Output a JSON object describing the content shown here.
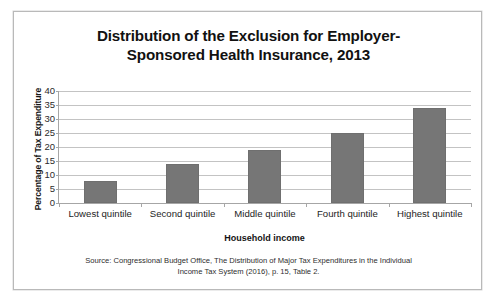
{
  "figure": {
    "title_line1": "Distribution of the Exclusion for Employer-",
    "title_line2": "Sponsored Health Insurance, 2013",
    "source_line1": "Source:  Congressional Budget Office, The Distribution of Major Tax Expenditures in the Individual",
    "source_line2": "Income Tax System (2016), p. 15, Table 2.",
    "bar_color": "#767676",
    "gridline_color": "#c3c3c3",
    "axis_color": "#a6a6a6",
    "frame_color": "#b9b9b9"
  },
  "chart_data": {
    "type": "bar",
    "categories": [
      "Lowest quintile",
      "Second quintile",
      "Middle quintile",
      "Fourth quintile",
      "Highest quintile"
    ],
    "values": [
      8,
      14,
      19,
      25,
      34
    ],
    "xlabel": "Household income",
    "ylabel": "Percentage of Tax Expenditure",
    "ylim": [
      0,
      40
    ],
    "ytick_values": [
      0,
      5,
      10,
      15,
      20,
      25,
      30,
      35,
      40
    ],
    "ytick_labels": [
      "0",
      "5",
      "10",
      "15",
      "20",
      "25",
      "30",
      "35",
      "40"
    ],
    "grid": true,
    "grid_axis": "y",
    "legend": false,
    "legend_position": "none"
  }
}
